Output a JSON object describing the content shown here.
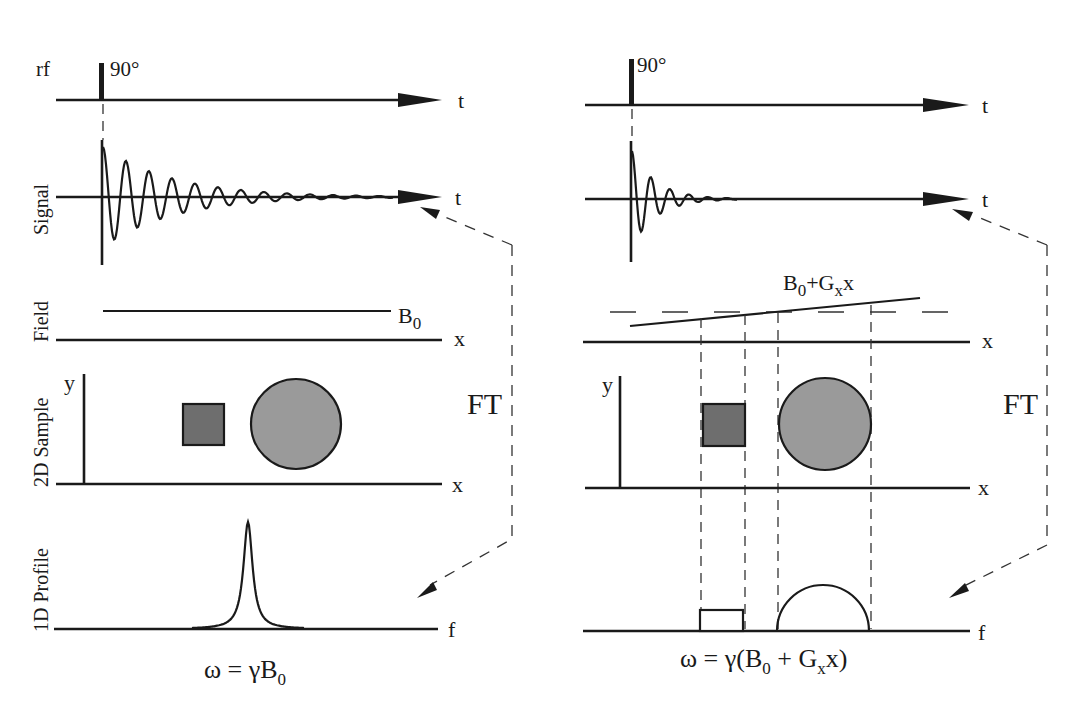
{
  "figure": {
    "row_labels": {
      "rf": "rf",
      "signal": "Signal",
      "field": "Field",
      "sample": "2D Sample",
      "profile": "1D Profile"
    },
    "colors": {
      "ink": "#1a1a1a",
      "square_fill": "#6e6e6e",
      "circle_fill": "#9a9a9a",
      "background": "#ffffff"
    },
    "left_panel": {
      "pulse_label": "90°",
      "rf_axis": "t",
      "signal_axis": "t",
      "field_label_main": "B",
      "field_label_sub": "0",
      "field_axis": "x",
      "sample_y_axis": "y",
      "sample_x_axis": "x",
      "profile_axis": "f",
      "ft_label": "FT",
      "equation": {
        "prefix": "ω = γB",
        "sub": "0"
      },
      "profile_shape": "single narrow Lorentzian peak"
    },
    "right_panel": {
      "pulse_label": "90°",
      "rf_axis": "t",
      "signal_axis": "t",
      "field_label_parts": [
        "B",
        "0",
        "+G",
        "x",
        "x"
      ],
      "field_axis": "x",
      "sample_y_axis": "y",
      "sample_x_axis": "x",
      "profile_axis": "f",
      "ft_label": "FT",
      "equation": {
        "p1": "ω = γ(B",
        "s1": "0",
        "p2": " + G",
        "s2": "x",
        "p3": "x)"
      },
      "profile_shape": "rectangle (from square) and semicircle (from circle)"
    }
  }
}
